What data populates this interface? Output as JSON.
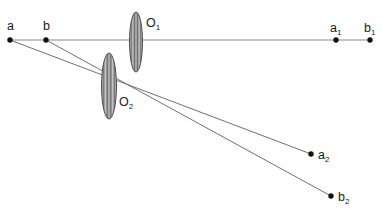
{
  "diagram": {
    "background_color": "#ffffff",
    "axis_color": "#8a8a8a",
    "ray_color": "#6f6f6f",
    "point_color": "#111111",
    "label_color": "#1a1a1a",
    "lens_stroke_color": "#4d4d4d",
    "lens_fill_color": "#b5b5b5",
    "axis": {
      "name": "optical-axis",
      "x1": 10,
      "y1": 40,
      "x2": 370,
      "y2": 40
    },
    "points": [
      {
        "id": "a",
        "label": "a",
        "sub": "",
        "x": 10,
        "y": 40,
        "label_x": 7,
        "label_y": 30
      },
      {
        "id": "b",
        "label": "b",
        "sub": "",
        "x": 46,
        "y": 40,
        "label_x": 43,
        "label_y": 30
      },
      {
        "id": "a1",
        "label": "a",
        "sub": "1",
        "x": 336,
        "y": 40,
        "label_x": 330,
        "label_y": 32
      },
      {
        "id": "b1",
        "label": "b",
        "sub": "1",
        "x": 370,
        "y": 40,
        "label_x": 364,
        "label_y": 32
      },
      {
        "id": "a2",
        "label": "a",
        "sub": "2",
        "x": 311,
        "y": 154,
        "label_x": 318,
        "label_y": 159
      },
      {
        "id": "b2",
        "label": "b",
        "sub": "2",
        "x": 331,
        "y": 196,
        "label_x": 338,
        "label_y": 201
      }
    ],
    "lenses": [
      {
        "id": "O1",
        "label": "O",
        "sub": "1",
        "cx": 136,
        "cy": 42,
        "rx": 6.5,
        "ry": 30,
        "label_x": 146,
        "label_y": 27
      },
      {
        "id": "O2",
        "label": "O",
        "sub": "2",
        "cx": 109,
        "cy": 86,
        "rx": 7.5,
        "ry": 33,
        "label_x": 119,
        "label_y": 106
      }
    ],
    "rays": [
      {
        "id": "ray-a",
        "from": "a",
        "to": "a2",
        "x1": 10,
        "y1": 40,
        "x2": 311,
        "y2": 154
      },
      {
        "id": "ray-b",
        "from": "b",
        "to": "b2",
        "x1": 46,
        "y1": 40,
        "x2": 331,
        "y2": 196
      }
    ]
  }
}
